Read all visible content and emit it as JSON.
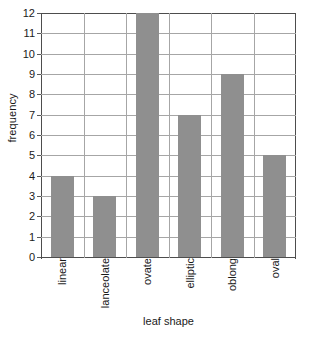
{
  "chart_data": {
    "type": "bar",
    "title": "",
    "subtitle": "",
    "categories": [
      "linear",
      "lanceolate",
      "ovate",
      "elliptic",
      "oblong",
      "oval"
    ],
    "values": [
      4,
      3,
      12,
      7,
      9,
      5
    ],
    "xlabel": "leaf shape",
    "ylabel": "frequency",
    "ylim": [
      0,
      12
    ],
    "ytick_step": 1,
    "yticks": [
      0,
      1,
      2,
      3,
      4,
      5,
      6,
      7,
      8,
      9,
      10,
      11,
      12
    ],
    "grid": {
      "horizontal": true,
      "vertical": true
    },
    "legend": {
      "visible": false,
      "position": "none"
    },
    "xtick_rotation": 90,
    "colors": {
      "bar_fill": "#8f8f8f",
      "grid_line": "#a6a6a6",
      "axis_line": "#4d4d4d",
      "text": "#1a1a1a",
      "background": "#ffffff"
    }
  }
}
